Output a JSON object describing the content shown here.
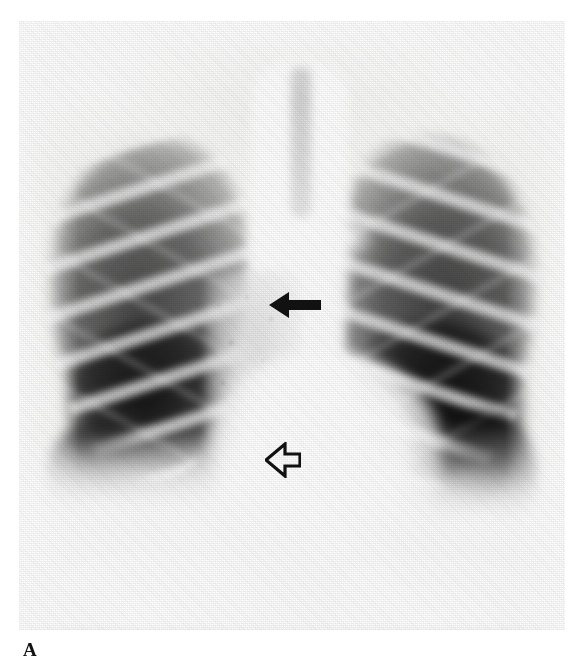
{
  "figure": {
    "label": "A",
    "modality": "chest-radiograph",
    "view": "PA (posteroanterior) erect",
    "caption_label_position": "bottom-left"
  },
  "image": {
    "width": 574,
    "height": 663,
    "plate": {
      "left": 19,
      "top": 21,
      "width": 546,
      "height": 609
    },
    "background_color": "#ffffff",
    "film_tone": "#f4f4f2",
    "grayscale": true
  },
  "annotations": [
    {
      "id": "solid-arrow",
      "style": "solid-filled",
      "direction": "left",
      "color": "#111111",
      "x": 250,
      "y": 270,
      "width": 52,
      "height": 28,
      "points_at": "right paratracheal / upper paramediastinal opacity"
    },
    {
      "id": "open-arrow",
      "style": "open-outline",
      "direction": "left",
      "color": "#111111",
      "x": 246,
      "y": 421,
      "width": 36,
      "height": 36,
      "points_at": "right lower paramediastinal / perihilar infiltrate"
    }
  ],
  "anatomy": {
    "regions": [
      {
        "name": "right-lung-field",
        "side": "patient-right",
        "appearance": "dark, well aerated with rib shadows"
      },
      {
        "name": "left-lung-field",
        "side": "patient-left",
        "appearance": "dark, well aerated with rib shadows"
      },
      {
        "name": "mediastinum",
        "appearance": "bright central opacity"
      },
      {
        "name": "trachea",
        "appearance": "midline lucent column"
      },
      {
        "name": "heart-silhouette",
        "appearance": "bright lower-central opacity"
      },
      {
        "name": "right-hemidiaphragm",
        "appearance": "bright dome, lower left of image"
      },
      {
        "name": "left-hemidiaphragm",
        "appearance": "bright dome, lower right of image"
      },
      {
        "name": "right-paramediastinal-infiltrate",
        "appearance": "hazy increased density between the two arrows"
      }
    ]
  }
}
